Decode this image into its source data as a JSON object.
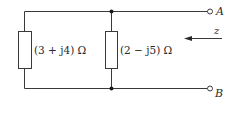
{
  "diagram": {
    "type": "circuit-parallel-impedances",
    "impedances": [
      {
        "id": "Z1",
        "label": "(3 + j4) Ω",
        "real": 3,
        "imag": 4,
        "unit": "Ω"
      },
      {
        "id": "Z2",
        "label": "(2 − j5) Ω",
        "real": 2,
        "imag": -5,
        "unit": "Ω"
      }
    ],
    "terminals": [
      {
        "id": "A",
        "label": "A"
      },
      {
        "id": "B",
        "label": "B"
      }
    ],
    "impedance_arrow": {
      "label": "z",
      "direction": "left"
    },
    "colors": {
      "wire": "#3a3a3a",
      "junction": "#1a1a1a",
      "background": "#ffffff"
    }
  }
}
